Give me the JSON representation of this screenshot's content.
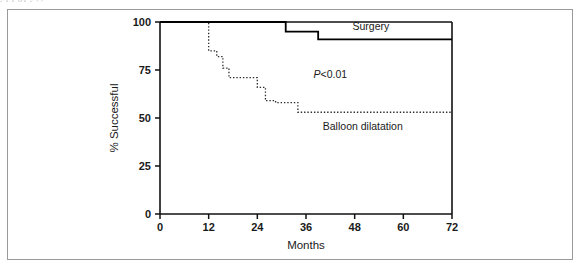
{
  "figure": {
    "border_color": "#9a9a9a",
    "background": "#ffffff"
  },
  "scan_artifact_text": "y  p       p                g                                  p     y  (  )",
  "chart_data": {
    "type": "line",
    "title": "",
    "subtitle": "",
    "xlabel": "Months",
    "ylabel": "% Successful",
    "xlim": [
      0,
      72
    ],
    "ylim": [
      0,
      100
    ],
    "xticks": [
      0,
      12,
      24,
      36,
      48,
      60,
      72
    ],
    "xtick_labels": [
      "0",
      "12",
      "24",
      "36",
      "48",
      "60",
      "72"
    ],
    "yticks": [
      0,
      25,
      50,
      75,
      100
    ],
    "ytick_labels": [
      "0",
      "25",
      "50",
      "75",
      "100"
    ],
    "grid": false,
    "legend_position": "inline-annotation",
    "step_style": "post",
    "annotations": [
      {
        "name": "p-value",
        "text_italic": "P",
        "text_rest": "<0.01",
        "x": 42,
        "y": 71
      },
      {
        "name": "surgery-label",
        "text": "Surgery",
        "x": 52,
        "y": 96
      },
      {
        "name": "balloon-label",
        "text": "Balloon dilatation",
        "x": 50,
        "y": 44
      }
    ],
    "series": [
      {
        "name": "Surgery",
        "linestyle": "solid",
        "color": "#000000",
        "linewidth": 1.8,
        "x": [
          0,
          31,
          31,
          39,
          39,
          72
        ],
        "y": [
          100,
          100,
          95,
          95,
          91,
          91
        ],
        "points": [
          {
            "x": 0,
            "y": 100
          },
          {
            "x": 31,
            "y": 100
          },
          {
            "x": 31,
            "y": 95
          },
          {
            "x": 39,
            "y": 95
          },
          {
            "x": 39,
            "y": 91
          },
          {
            "x": 72,
            "y": 91
          }
        ]
      },
      {
        "name": "Balloon dilatation",
        "linestyle": "dotted",
        "color": "#2b2b2b",
        "linewidth": 1.3,
        "x": [
          0,
          12,
          12,
          14,
          14,
          15.5,
          15.5,
          17,
          17,
          18,
          18,
          24,
          24,
          26,
          26,
          28.5,
          28.5,
          34,
          34,
          72
        ],
        "y": [
          100,
          100,
          85,
          85,
          82,
          82,
          76,
          76,
          71,
          71,
          71,
          71,
          66,
          66,
          59,
          59,
          58,
          58,
          53,
          53
        ],
        "points": [
          {
            "x": 0,
            "y": 100
          },
          {
            "x": 12,
            "y": 100
          },
          {
            "x": 12,
            "y": 85
          },
          {
            "x": 14,
            "y": 85
          },
          {
            "x": 14,
            "y": 82
          },
          {
            "x": 15.5,
            "y": 82
          },
          {
            "x": 15.5,
            "y": 76
          },
          {
            "x": 17,
            "y": 76
          },
          {
            "x": 17,
            "y": 71
          },
          {
            "x": 24,
            "y": 71
          },
          {
            "x": 24,
            "y": 66
          },
          {
            "x": 26,
            "y": 66
          },
          {
            "x": 26,
            "y": 59
          },
          {
            "x": 28.5,
            "y": 59
          },
          {
            "x": 28.5,
            "y": 58
          },
          {
            "x": 34,
            "y": 58
          },
          {
            "x": 34,
            "y": 53
          },
          {
            "x": 72,
            "y": 53
          }
        ]
      }
    ]
  }
}
